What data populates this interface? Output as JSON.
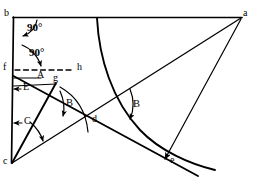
{
  "figure": {
    "type": "geometric-construction-diagram",
    "background_color": "#ffffff",
    "stroke_color": "#000000",
    "width": 259,
    "height": 183
  },
  "points": [
    {
      "id": "b",
      "label": "b",
      "x": 13,
      "y": 17,
      "label_x": 5,
      "label_y": 9
    },
    {
      "id": "a",
      "label": "a",
      "x": 242,
      "y": 17,
      "label_x": 243,
      "label_y": 9
    },
    {
      "id": "f",
      "label": "f",
      "x": 14,
      "y": 70,
      "label_x": 4,
      "label_y": 63
    },
    {
      "id": "h",
      "label": "h",
      "x": 76,
      "y": 70,
      "label_x": 77,
      "label_y": 63
    },
    {
      "id": "A",
      "label": "A",
      "x": 41,
      "y": 78,
      "label_x": 37,
      "label_y": 70
    },
    {
      "id": "E",
      "label": "E",
      "x": 14,
      "y": 89,
      "label_x": 22,
      "label_y": 82
    },
    {
      "id": "g",
      "label": "g",
      "x": 57,
      "y": 84,
      "label_x": 53,
      "label_y": 74
    },
    {
      "id": "C",
      "label": "C",
      "x": 14,
      "y": 123,
      "label_x": 23,
      "label_y": 117
    },
    {
      "id": "d",
      "label": "d",
      "x": 97,
      "y": 121,
      "label_x": 93,
      "label_y": 114
    },
    {
      "id": "c",
      "label": "c",
      "x": 12,
      "y": 163,
      "label_x": 4,
      "label_y": 157
    },
    {
      "id": "e",
      "label": "e",
      "x": 164,
      "y": 164,
      "label_x": 171,
      "label_y": 155
    }
  ],
  "angle_labels": [
    {
      "id": "deg-top",
      "text": "90°",
      "x": 27,
      "y": 23
    },
    {
      "id": "deg-bottom",
      "text": "90°",
      "x": 29,
      "y": 48
    },
    {
      "id": "theta-g",
      "text": "B",
      "x": 66,
      "y": 99
    },
    {
      "id": "beta-right",
      "text": "B",
      "x": 133,
      "y": 100
    }
  ],
  "segments": [
    {
      "id": "top-edge-b-a",
      "from": "b",
      "to": "a",
      "style": "solid",
      "width": 1.6
    },
    {
      "id": "left-edge-b-c",
      "from": "b",
      "to": "c",
      "style": "solid",
      "width": 1.6
    },
    {
      "id": "dashed-f-h",
      "from": "f",
      "to": "h",
      "style": "dashed",
      "width": 1.3
    },
    {
      "id": "line-f-through-g-e",
      "from": "f",
      "to": "e",
      "style": "solid",
      "width": 1.8
    },
    {
      "id": "line-c-to-g",
      "from": "c",
      "to": "g",
      "style": "solid",
      "width": 1.8
    },
    {
      "id": "line-c-to-a",
      "from": "c",
      "to": "a",
      "style": "solid",
      "width": 1.4
    },
    {
      "id": "line-a-to-e",
      "from": "a",
      "to": "e",
      "style": "solid",
      "width": 1.2,
      "arrow": true
    }
  ],
  "curves": [
    {
      "id": "main-arc-top-to-e",
      "description": "concave arc from top edge down through right region to e and beyond"
    },
    {
      "id": "small-arc-below-g",
      "description": "short arc below g curving down-right"
    }
  ],
  "markers": [
    {
      "id": "arrow-E",
      "description": "left-pointing arrow at E on left edge"
    },
    {
      "id": "arrow-C",
      "description": "left-pointing arrow at C on left edge"
    },
    {
      "id": "arrow-90-top",
      "description": "curved arrow from top edge to left edge"
    },
    {
      "id": "arrow-90-bottom",
      "description": "curved arrow from left edge to A"
    }
  ]
}
